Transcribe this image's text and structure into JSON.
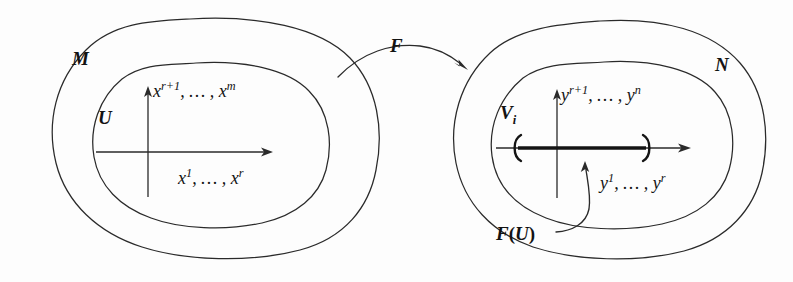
{
  "figure": {
    "type": "mathematical-diagram",
    "background_color": "#fdfdfd",
    "ink_color": "#131313"
  },
  "left": {
    "manifold_label": "M",
    "chart_label": "U",
    "vertical_axis_label_parts": {
      "base1": "x",
      "sup1": "r+1",
      "mid": ", … , ",
      "base2": "x",
      "sup2": "m"
    },
    "vertical_axis_label": "xʳ⁺¹, … , xᵐ",
    "horizontal_axis_label_parts": {
      "base1": "x",
      "sup1": "1",
      "mid": ", … , ",
      "base2": "x",
      "sup2": "r"
    },
    "horizontal_axis_label": "x¹, … , xʳ"
  },
  "map": {
    "label": "F",
    "arrow_direction": "left-to-right-arc"
  },
  "right": {
    "manifold_label": "N",
    "chart_label_parts": {
      "base": "V",
      "sub": "i"
    },
    "chart_label": "Vᵢ",
    "vertical_axis_label_parts": {
      "base1": "y",
      "sup1": "r+1",
      "mid": ", … , ",
      "base2": "y",
      "sup2": "n"
    },
    "vertical_axis_label": "yʳ⁺¹, … , yⁿ",
    "horizontal_axis_label_parts": {
      "base1": "y",
      "sup1": "1",
      "mid": ", … , ",
      "base2": "y",
      "sup2": "r"
    },
    "horizontal_axis_label": "y¹, … , yʳ",
    "image_label_parts": {
      "f": "F",
      "open": "(",
      "u": "U",
      "close": ")"
    },
    "image_label": "F(U)",
    "image_interval": {
      "open_bracket": "(",
      "close_bracket": ")",
      "note": "thick segment on horizontal axis bounded by round parentheses"
    }
  }
}
